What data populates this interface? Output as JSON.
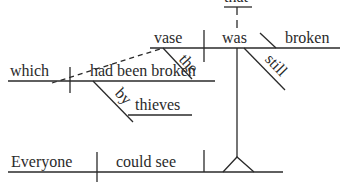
{
  "diagram": {
    "type": "Reed-Kellogg sentence diagram",
    "words": {
      "that": "that",
      "vase": "vase",
      "was": "was",
      "broken": "broken",
      "the": "the",
      "still": "still",
      "which": "which",
      "had_been_broken": "had been broken",
      "by": "by",
      "thieves": "thieves",
      "everyone": "Everyone",
      "could_see": "could see"
    },
    "line_color": "#2a2a2a"
  }
}
